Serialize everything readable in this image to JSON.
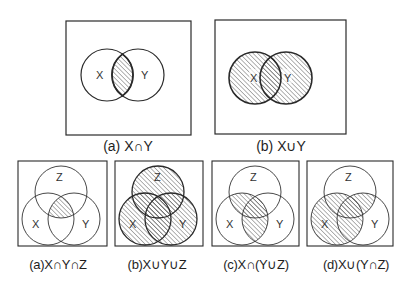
{
  "figure": {
    "colors": {
      "stroke": "#2a2a2a",
      "hatch": "#555555",
      "background": "#ffffff"
    },
    "top_row": [
      {
        "id": "a",
        "caption": "(a) X∩Y",
        "sets": [
          "X",
          "Y"
        ],
        "shaded": "intersection of X and Y"
      },
      {
        "id": "b",
        "caption": "(b) X∪Y",
        "sets": [
          "X",
          "Y"
        ],
        "shaded": "union of X and Y"
      }
    ],
    "bottom_row": [
      {
        "id": "a",
        "caption": "(a)X∩Y∩Z",
        "sets": [
          "X",
          "Y",
          "Z"
        ],
        "shaded": "intersection of X, Y and Z"
      },
      {
        "id": "b",
        "caption": "(b)X∪Y∪Z",
        "sets": [
          "X",
          "Y",
          "Z"
        ],
        "shaded": "union of X, Y and Z"
      },
      {
        "id": "c",
        "caption": "(c)X∩(Y∪Z)",
        "sets": [
          "X",
          "Y",
          "Z"
        ],
        "shaded": "X intersected with union of Y and Z"
      },
      {
        "id": "d",
        "caption": "(d)X∪(Y∩Z)",
        "sets": [
          "X",
          "Y",
          "Z"
        ],
        "shaded": "X united with intersection of Y and Z"
      }
    ],
    "labels": {
      "x": "X",
      "y": "Y",
      "z": "Z"
    }
  }
}
